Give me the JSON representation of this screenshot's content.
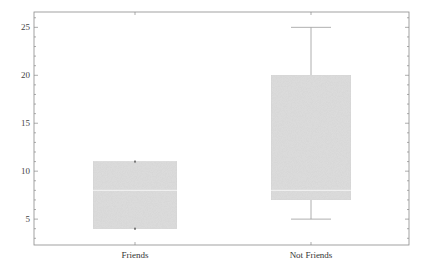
{
  "chart_data": {
    "type": "box",
    "title": "",
    "xlabel": "",
    "ylabel": "",
    "categories": [
      "Friends",
      "Not Friends"
    ],
    "ylim": [
      2.3,
      26.6
    ],
    "yticks": [
      5,
      10,
      15,
      20,
      25
    ],
    "grid": false,
    "legend": null,
    "series": [
      {
        "name": "Friends",
        "min": 4,
        "q1": 4,
        "median": 8,
        "q3": 11,
        "max": 11
      },
      {
        "name": "Not Friends",
        "min": 5,
        "q1": 7,
        "median": 8,
        "q3": 20,
        "max": 25
      }
    ]
  },
  "style": {
    "box_fill": "#dedede",
    "box_stroke": "#d0d0d0",
    "frame_color": "#8a8a8a",
    "whisker_color": "#9a9a9a",
    "median_color": "#f4f4f4"
  }
}
